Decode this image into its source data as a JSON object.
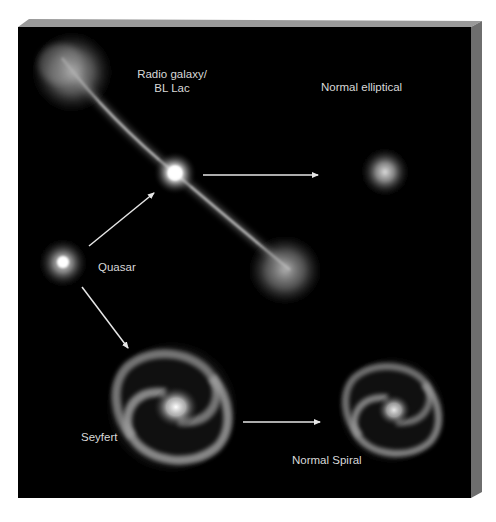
{
  "figure": {
    "background_color": "#000000",
    "bevel_top_color": "#9a9a9a",
    "bevel_side_color": "#6e6e6e",
    "page_color": "#ffffff",
    "text_color": "#d8d8d8"
  },
  "nodes": {
    "radio_galaxy": {
      "label_line1": "Radio galaxy/",
      "label_line2": "BL Lac"
    },
    "normal_elliptical": {
      "label": "Normal elliptical"
    },
    "quasar": {
      "label": "Quasar"
    },
    "seyfert": {
      "label": "Seyfert"
    },
    "normal_spiral": {
      "label": "Normal Spiral"
    }
  },
  "edges": [
    {
      "from": "Quasar",
      "to": "Radio galaxy/BL Lac"
    },
    {
      "from": "Quasar",
      "to": "Seyfert"
    },
    {
      "from": "Radio galaxy/BL Lac",
      "to": "Normal elliptical"
    },
    {
      "from": "Seyfert",
      "to": "Normal Spiral"
    }
  ]
}
